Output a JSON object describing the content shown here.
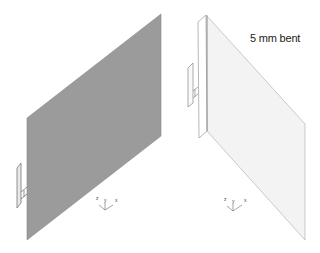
{
  "figure": {
    "left_view": {
      "panel_color": "#999999",
      "axis_labels": {
        "z": "z",
        "y": "y",
        "x": "x"
      }
    },
    "right_view": {
      "panel_color": "#f3f3f3",
      "annotation": "5 mm bent",
      "axis_labels": {
        "z": "z",
        "y": "y",
        "x": "x"
      }
    }
  }
}
